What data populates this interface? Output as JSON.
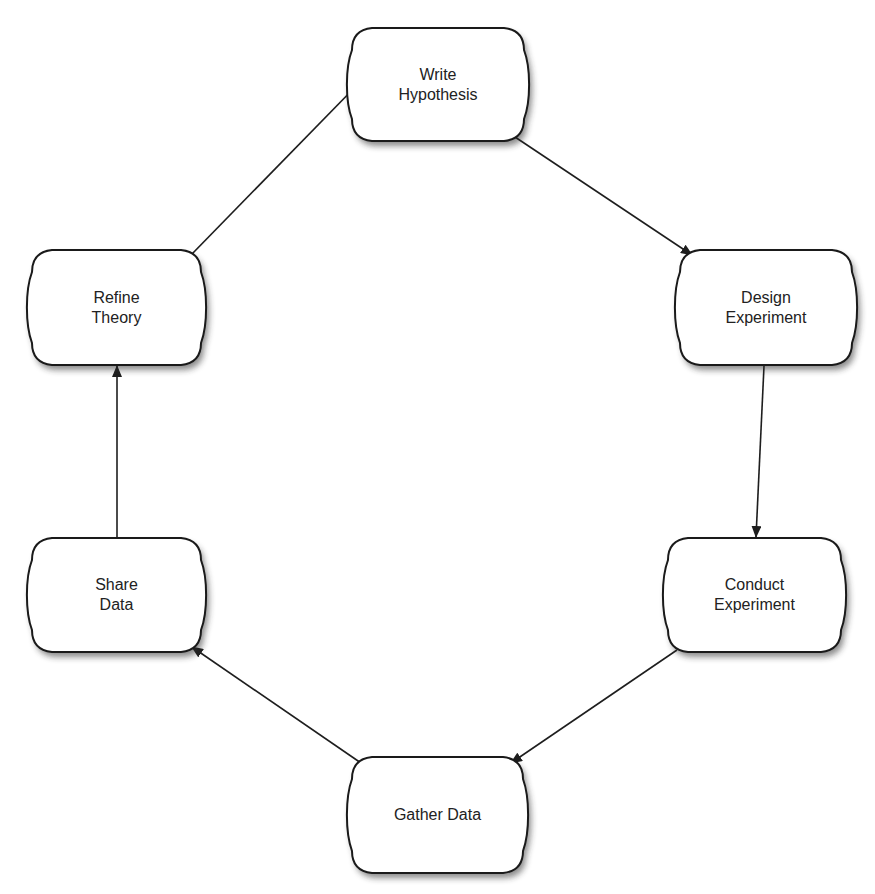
{
  "diagram": {
    "type": "cycle-flowchart",
    "colors": {
      "node_fill": "#ffffff",
      "node_stroke": "#1a1a1a",
      "edge": "#1e1e1e",
      "text": "#222222",
      "background": "#ffffff"
    },
    "nodes": [
      {
        "id": "write-hypothesis",
        "lines": [
          "Write",
          "Hypothesis"
        ],
        "x": 350,
        "y": 28,
        "w": 176,
        "h": 113
      },
      {
        "id": "design-experiment",
        "lines": [
          "Design",
          "Experiment"
        ],
        "x": 678,
        "y": 250,
        "w": 176,
        "h": 115
      },
      {
        "id": "conduct-experiment",
        "lines": [
          "Conduct",
          "Experiment"
        ],
        "x": 666,
        "y": 538,
        "w": 177,
        "h": 114
      },
      {
        "id": "gather-data",
        "lines": [
          "Gather Data"
        ],
        "x": 350,
        "y": 757,
        "w": 175,
        "h": 116
      },
      {
        "id": "share-data",
        "lines": [
          "Share",
          "Data"
        ],
        "x": 30,
        "y": 538,
        "w": 173,
        "h": 114
      },
      {
        "id": "refine-theory",
        "lines": [
          "Refine",
          "Theory"
        ],
        "x": 30,
        "y": 250,
        "w": 173,
        "h": 115
      }
    ],
    "edges": [
      {
        "from": "write-hypothesis",
        "to": "design-experiment",
        "x1": 515,
        "y1": 137,
        "x2": 692,
        "y2": 255
      },
      {
        "from": "design-experiment",
        "to": "conduct-experiment",
        "x1": 764,
        "y1": 366,
        "x2": 756,
        "y2": 537
      },
      {
        "from": "conduct-experiment",
        "to": "gather-data",
        "x1": 677,
        "y1": 650,
        "x2": 511,
        "y2": 763
      },
      {
        "from": "gather-data",
        "to": "share-data",
        "x1": 361,
        "y1": 763,
        "x2": 192,
        "y2": 647
      },
      {
        "from": "share-data",
        "to": "refine-theory",
        "x1": 117,
        "y1": 538,
        "x2": 117,
        "y2": 366
      },
      {
        "from": "refine-theory",
        "to": "write-hypothesis",
        "x1": 190,
        "y1": 256,
        "x2": 362,
        "y2": 80
      }
    ]
  },
  "labels": {
    "write_hypothesis": {
      "line1": "Write",
      "line2": "Hypothesis"
    },
    "design_experiment": {
      "line1": "Design",
      "line2": "Experiment"
    },
    "conduct_experiment": {
      "line1": "Conduct",
      "line2": "Experiment"
    },
    "gather_data": {
      "line1": "Gather Data"
    },
    "share_data": {
      "line1": "Share",
      "line2": "Data"
    },
    "refine_theory": {
      "line1": "Refine",
      "line2": "Theory"
    }
  }
}
